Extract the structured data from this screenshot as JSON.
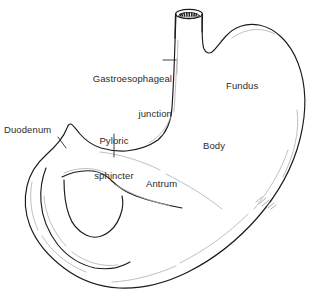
{
  "figure": {
    "style": "black-and-white medical line art",
    "line_color": "#1a1a1a",
    "sketch_line_color": "#b0b0b0",
    "text_color": "#2b2b2b",
    "background_color": "#ffffff"
  },
  "labels": {
    "gastroesophageal_junction": {
      "line1": "Gastroesophageal",
      "line2": "junction",
      "leader": "dash pointing right to esophagus"
    },
    "pyloric_sphincter": {
      "line1": "Pyloric",
      "line2": "sphincter",
      "leader": "vertical line pointing down to lesser curvature notch"
    },
    "duodenum": {
      "text": "Duodenum",
      "leader": "short diagonal line down-right to duodenal wall"
    },
    "fundus": {
      "text": "Fundus",
      "leader": "none"
    },
    "body": {
      "text": "Body",
      "leader": "none"
    },
    "antrum": {
      "text": "Antrum",
      "leader": "none"
    }
  },
  "structures": [
    "esophagus",
    "gastroesophageal junction",
    "cardiac notch",
    "fundus",
    "body",
    "greater curvature",
    "lesser curvature",
    "antrum",
    "pyloric sphincter",
    "duodenum"
  ]
}
